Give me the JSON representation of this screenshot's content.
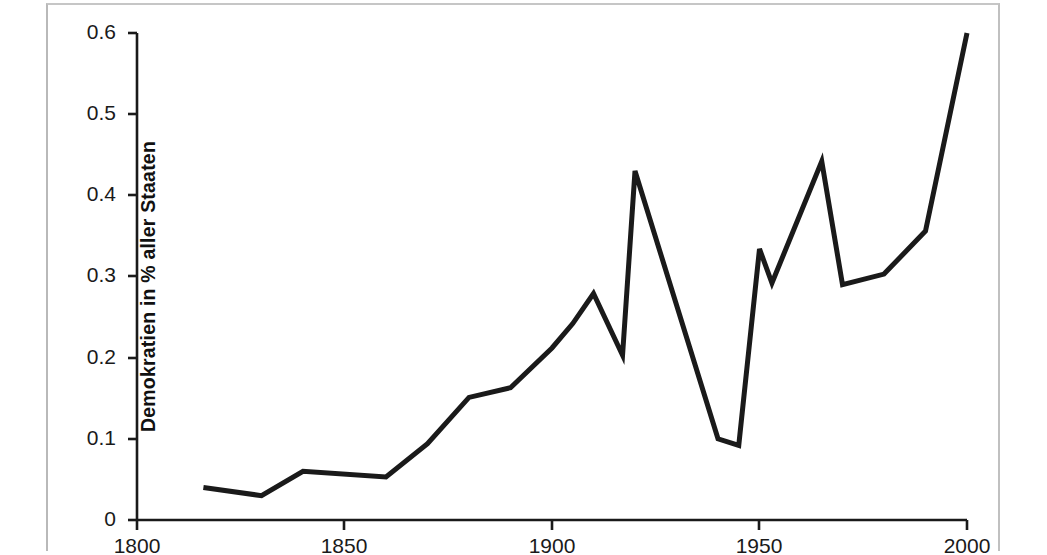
{
  "chart_data": {
    "type": "line",
    "title": "",
    "subtitle": "",
    "xlabel": "",
    "ylabel": "Demokratien in % aller Staaten",
    "xlim": [
      1800,
      2000
    ],
    "ylim": [
      0,
      0.6
    ],
    "xticks": [
      1800,
      1850,
      1900,
      1950,
      2000
    ],
    "xtick_labels": [
      "1800",
      "1850",
      "1900",
      "1950",
      "2000"
    ],
    "yticks": [
      0,
      0.1,
      0.2,
      0.3,
      0.4,
      0.5,
      0.6
    ],
    "ytick_labels": [
      "0",
      "0.1",
      "0.2",
      "0.3",
      "0.4",
      "0.5",
      "0.6"
    ],
    "grid": false,
    "legend": null,
    "annotations": [],
    "line_color": "#1a1a1a",
    "line_width": 5,
    "series": [
      {
        "name": "Demokratien in % aller Staaten",
        "x": [
          1816,
          1830,
          1840,
          1860,
          1870,
          1880,
          1890,
          1900,
          1905,
          1910,
          1917,
          1920,
          1945,
          1950,
          1953,
          1965,
          1970,
          1980,
          1990,
          2000
        ],
        "values": [
          0.04,
          0.03,
          0.06,
          0.053,
          0.094,
          0.151,
          0.163,
          0.212,
          0.242,
          0.279,
          0.203,
          0.43,
          0.092,
          0.334,
          0.292,
          0.442,
          0.29,
          0.303,
          0.356,
          0.6
        ]
      }
    ],
    "extra_points": {
      "1940": 0.1
    }
  },
  "axis": {
    "ylabel_text": "Demokratien in % aller Staaten",
    "ytick_0": "0",
    "ytick_01": "0.1",
    "ytick_02": "0.2",
    "ytick_03": "0.3",
    "ytick_04": "0.4",
    "ytick_05": "0.5",
    "ytick_06": "0.6",
    "xtick_1800": "1800",
    "xtick_1850": "1850",
    "xtick_1900": "1900",
    "xtick_1950": "1950",
    "xtick_2000": "2000"
  }
}
